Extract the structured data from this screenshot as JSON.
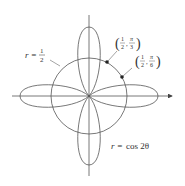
{
  "diagram": {
    "type": "polar-plot",
    "curves": [
      {
        "name": "rose",
        "equation": "r = cos 2θ",
        "label_r": "r =",
        "label_rhs": "cos 2θ"
      },
      {
        "name": "circle",
        "equation": "r = 1/2",
        "label_r": "r =",
        "label_num": "1",
        "label_den": "2"
      }
    ],
    "points": [
      {
        "label_num": "1",
        "label_den": "2",
        "angle_num": "π",
        "angle_den": "3",
        "text": "(1/2, π/3)"
      },
      {
        "label_num": "1",
        "label_den": "2",
        "angle_num": "π",
        "angle_den": "6",
        "text": "(1/2, π/6)"
      }
    ],
    "colors": {
      "curve": "#555555",
      "axis": "#555555",
      "text": "#333333"
    }
  }
}
